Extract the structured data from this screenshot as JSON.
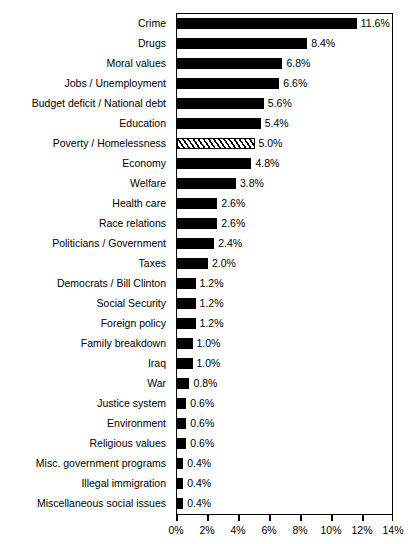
{
  "top_sliver_text": "",
  "chart_data": {
    "type": "bar",
    "orientation": "horizontal",
    "title": "",
    "subtitle": "",
    "xlabel": "",
    "ylabel": "",
    "xlim": [
      0,
      14
    ],
    "grid": false,
    "legend": null,
    "tick_labels": [
      "0%",
      "2%",
      "4%",
      "6%",
      "8%",
      "10%",
      "12%",
      "14%"
    ],
    "tick_values": [
      0,
      2,
      4,
      6,
      8,
      10,
      12,
      14
    ],
    "value_suffix": "%",
    "colors": {
      "bar_fill": "#000000",
      "highlight_fill_pattern": "diagonal-hatch",
      "axis": "#000000",
      "background": "#ffffff"
    },
    "categories": [
      "Crime",
      "Drugs",
      "Moral values",
      "Jobs / Unemployment",
      "Budget deficit / National debt",
      "Education",
      "Poverty / Homelessness",
      "Economy",
      "Welfare",
      "Health care",
      "Race relations",
      "Politicians / Government",
      "Taxes",
      "Democrats / Bill Clinton",
      "Social Security",
      "Foreign policy",
      "Family breakdown",
      "Iraq",
      "War",
      "Justice system",
      "Environment",
      "Religious values",
      "Misc. government programs",
      "Illegal immigration",
      "Miscellaneous social issues"
    ],
    "values": [
      11.6,
      8.4,
      6.8,
      6.6,
      5.6,
      5.4,
      5.0,
      4.8,
      3.8,
      2.6,
      2.6,
      2.4,
      2.0,
      1.2,
      1.2,
      1.2,
      1.0,
      1.0,
      0.8,
      0.6,
      0.6,
      0.6,
      0.4,
      0.4,
      0.4
    ],
    "value_labels": [
      "11.6%",
      "8.4%",
      "6.8%",
      "6.6%",
      "5.6%",
      "5.4%",
      "5.0%",
      "4.8%",
      "3.8%",
      "2.6%",
      "2.6%",
      "2.4%",
      "2.0%",
      "1.2%",
      "1.2%",
      "1.2%",
      "1.0%",
      "1.0%",
      "0.8%",
      "0.6%",
      "0.6%",
      "0.6%",
      "0.4%",
      "0.4%",
      "0.4%"
    ],
    "highlighted_index": 6
  }
}
